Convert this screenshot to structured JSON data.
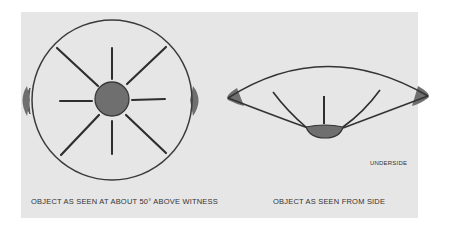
{
  "diagram": {
    "top_view": {
      "caption": "OBJECT AS SEEN AT ABOUT 50° ABOVE WITNESS",
      "shape": "circle-with-radial-spokes",
      "spoke_count": 8,
      "has_central_hub": true,
      "side_fins": 2
    },
    "side_view": {
      "caption": "OBJECT AS SEEN FROM SIDE",
      "shape": "lens-profile",
      "inner_ribs": 3,
      "underside_label": "UNDERSIDE"
    },
    "colors": {
      "background": "#e6e6e6",
      "line": "#333333",
      "fill": "#6f6f6f"
    }
  }
}
